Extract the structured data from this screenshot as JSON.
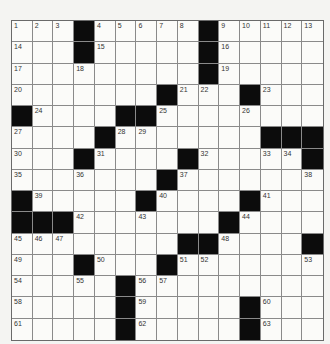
{
  "puzzle": {
    "rows": 15,
    "cols": 15,
    "colors": {
      "block": "#0c0c0c",
      "cell": "#fbfbf9",
      "grid_line": "#8a8a8a",
      "number": "#333333",
      "background": "#f4f4f2"
    },
    "grid": [
      [
        "1",
        "2",
        "3",
        "#",
        "4",
        "5",
        "6",
        "7",
        "8",
        "#",
        "9",
        "10",
        "11",
        "12",
        "13"
      ],
      [
        "14",
        "",
        "",
        "#",
        "15",
        "",
        "",
        "",
        "",
        "#",
        "16",
        "",
        "",
        "",
        ""
      ],
      [
        "17",
        "",
        "",
        "18",
        "",
        "",
        "",
        "",
        "",
        "#",
        "19",
        "",
        "",
        "",
        ""
      ],
      [
        "20",
        "",
        "",
        "",
        "",
        "",
        "",
        "#",
        "21",
        "22",
        "",
        "#",
        "23",
        "",
        ""
      ],
      [
        "#",
        "24",
        "",
        "",
        "",
        "#",
        "#",
        "25",
        "",
        "",
        "",
        "26",
        "",
        "",
        ""
      ],
      [
        "27",
        "",
        "",
        "",
        "#",
        "28",
        "29",
        "",
        "",
        "",
        "",
        "",
        "#",
        "#",
        "#"
      ],
      [
        "30",
        "",
        "",
        "#",
        "31",
        "",
        "",
        "",
        "#",
        "32",
        "",
        "",
        "33",
        "34",
        "#"
      ],
      [
        "35",
        "",
        "",
        "36",
        "",
        "",
        "",
        "#",
        "37",
        "",
        "",
        "",
        "",
        "",
        "38"
      ],
      [
        "#",
        "39",
        "",
        "",
        "",
        "",
        "#",
        "40",
        "",
        "",
        "",
        "#",
        "41",
        "",
        ""
      ],
      [
        "#",
        "#",
        "#",
        "42",
        "",
        "",
        "43",
        "",
        "",
        "",
        "#",
        "44",
        "",
        "",
        ""
      ],
      [
        "45",
        "46",
        "47",
        "",
        "",
        "",
        "",
        "",
        "#",
        "#",
        "48",
        "",
        "",
        "",
        "#"
      ],
      [
        "49",
        "",
        "",
        "#",
        "50",
        "",
        "",
        "#",
        "51",
        "52",
        "",
        "",
        "",
        "",
        "53"
      ],
      [
        "54",
        "",
        "",
        "55",
        "",
        "#",
        "56",
        "57",
        "",
        "",
        "",
        "",
        "",
        "",
        ""
      ],
      [
        "58",
        "",
        "",
        "",
        "",
        "#",
        "59",
        "",
        "",
        "",
        "",
        "#",
        "60",
        "",
        ""
      ],
      [
        "61",
        "",
        "",
        "",
        "",
        "#",
        "62",
        "",
        "",
        "",
        "",
        "#",
        "63",
        "",
        ""
      ]
    ],
    "entries": []
  }
}
